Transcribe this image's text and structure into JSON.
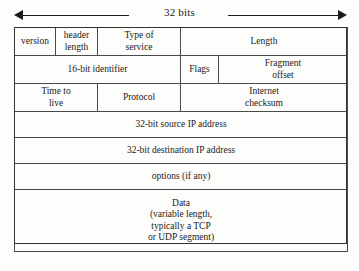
{
  "diagram": {
    "width_annotation": {
      "label": "32 bits",
      "arrow_left_icon": "arrow-left-icon",
      "arrow_right_icon": "arrow-right-icon"
    },
    "rows": [
      {
        "name": "row-1",
        "cells": [
          {
            "name": "field-version",
            "label": "version"
          },
          {
            "name": "field-header-length",
            "label": "header\nlength"
          },
          {
            "name": "field-type-of-service",
            "label": "Type of\nservice"
          },
          {
            "name": "field-length",
            "label": "Length"
          }
        ]
      },
      {
        "name": "row-2",
        "cells": [
          {
            "name": "field-identifier",
            "label": "16-bit identifier"
          },
          {
            "name": "field-flags",
            "label": "Flags"
          },
          {
            "name": "field-fragment-offset",
            "label": "Fragment\noffset"
          }
        ]
      },
      {
        "name": "row-3",
        "cells": [
          {
            "name": "field-time-to-live",
            "label": "Time to\nlive"
          },
          {
            "name": "field-protocol",
            "label": "Protocol"
          },
          {
            "name": "field-internet-checksum",
            "label": "Internet\nchecksum"
          }
        ]
      },
      {
        "name": "row-4",
        "cells": [
          {
            "name": "field-source-ip-address",
            "label": "32-bit source IP address"
          }
        ]
      },
      {
        "name": "row-5",
        "cells": [
          {
            "name": "field-destination-ip-address",
            "label": "32-bit destination IP address"
          }
        ]
      },
      {
        "name": "row-6",
        "cells": [
          {
            "name": "field-options",
            "label": "options (if any)"
          }
        ]
      },
      {
        "name": "row-7",
        "cells": [
          {
            "name": "field-data",
            "label": "Data\n(variable length,\ntypically a TCP\nor UDP  segment)"
          }
        ]
      }
    ],
    "colors": {
      "background": "#fdfdfb",
      "line": "#4a4a4a",
      "outer_line": "#333333",
      "text": "#1b1b1b"
    }
  }
}
